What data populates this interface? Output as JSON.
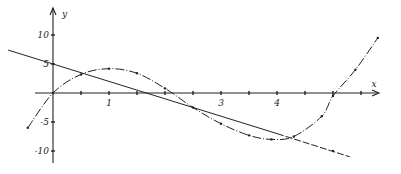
{
  "chart_data": {
    "type": "line",
    "title": "",
    "xlabel": "x",
    "ylabel": "y",
    "x_ticks": [
      1,
      2,
      3,
      4
    ],
    "x_tick_labels": [
      "1",
      "",
      "3",
      "4"
    ],
    "y_ticks": [
      10,
      5,
      -5,
      -10
    ],
    "y_tick_labels": [
      "10",
      "5",
      "-5",
      "-10"
    ],
    "xlim": [
      -0.9,
      6.2
    ],
    "ylim": [
      -12,
      14
    ],
    "grid": false,
    "legend": null,
    "series": [
      {
        "name": "cubic curve",
        "style": "dash-dot",
        "points": [
          [
            -0.45,
            -6
          ],
          [
            0,
            0
          ],
          [
            0.5,
            3.2
          ],
          [
            1,
            4.2
          ],
          [
            1.5,
            3.4
          ],
          [
            2,
            0.8
          ],
          [
            2.5,
            -2.5
          ],
          [
            3,
            -5.3
          ],
          [
            3.5,
            -7.3
          ],
          [
            3.9,
            -8
          ],
          [
            4.3,
            -7.5
          ],
          [
            4.8,
            -4
          ],
          [
            5,
            -0.5
          ],
          [
            5.4,
            4
          ],
          [
            5.8,
            9.5
          ]
        ]
      },
      {
        "name": "straight line",
        "style": "solid-then-dashed",
        "points": [
          [
            -0.8,
            7.4
          ],
          [
            0,
            5
          ],
          [
            1,
            2
          ],
          [
            2,
            -1
          ],
          [
            3,
            -4
          ],
          [
            4,
            -7
          ],
          [
            5,
            -10
          ],
          [
            5.3,
            -11
          ]
        ]
      }
    ]
  }
}
